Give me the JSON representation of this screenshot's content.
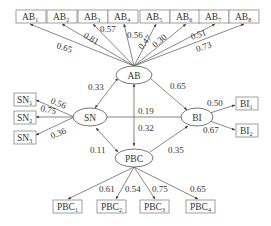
{
  "diagram": {
    "type": "structural-equation-model",
    "latent": {
      "AB": "AB",
      "SN": "SN",
      "BI": "BI",
      "PBC": "PBC"
    },
    "ab_indicators": [
      {
        "base": "AB",
        "sub": "1",
        "loading": "0.65"
      },
      {
        "base": "AB",
        "sub": "2",
        "loading": "0.81"
      },
      {
        "base": "AB",
        "sub": "3",
        "loading": "0.57"
      },
      {
        "base": "AB",
        "sub": "4",
        "loading": "0.56"
      },
      {
        "base": "AB",
        "sub": "5",
        "loading": "0.47"
      },
      {
        "base": "AB",
        "sub": "6",
        "loading": "0.30"
      },
      {
        "base": "AB",
        "sub": "7",
        "loading": "0.51"
      },
      {
        "base": "AB",
        "sub": "8",
        "loading": "0.73"
      }
    ],
    "sn_indicators": [
      {
        "base": "SN",
        "sub": "1",
        "loading": "0.56"
      },
      {
        "base": "SN",
        "sub": "2",
        "loading": "0.75"
      },
      {
        "base": "SN",
        "sub": "3",
        "loading": "0.36"
      }
    ],
    "bi_indicators": [
      {
        "base": "BI",
        "sub": "1",
        "loading": "0.50"
      },
      {
        "base": "BI",
        "sub": "2",
        "loading": "0.67"
      }
    ],
    "pbc_indicators": [
      {
        "base": "PBC",
        "sub": "1",
        "loading": "0.61"
      },
      {
        "base": "PBC",
        "sub": "2",
        "loading": "0.54"
      },
      {
        "base": "PBC",
        "sub": "3",
        "loading": "0.75"
      },
      {
        "base": "PBC",
        "sub": "4",
        "loading": "0.65"
      }
    ],
    "paths": {
      "AB_SN": "0.33",
      "AB_BI": "0.65",
      "SN_BI": "0.19",
      "AB_PBC": "0.32",
      "SN_PBC": "0.11",
      "PBC_BI": "0.35"
    }
  }
}
